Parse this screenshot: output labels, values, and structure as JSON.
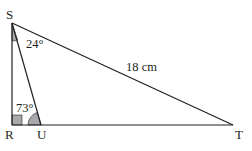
{
  "diagram": {
    "type": "triangle-geometry",
    "vertices": {
      "S": {
        "label": "S",
        "x": 12,
        "y": 23
      },
      "R": {
        "label": "R",
        "x": 12,
        "y": 125
      },
      "U": {
        "label": "U",
        "x": 41,
        "y": 125
      },
      "T": {
        "label": "T",
        "x": 233,
        "y": 125
      }
    },
    "angles": {
      "RSU": {
        "label": "24°"
      },
      "SUR": {
        "label": "73°"
      },
      "SRU": {
        "label": "right-angle"
      }
    },
    "sides": {
      "ST": {
        "label": "18 cm"
      }
    },
    "colors": {
      "line": "#231f20",
      "shade": "#a7a9ac"
    }
  }
}
